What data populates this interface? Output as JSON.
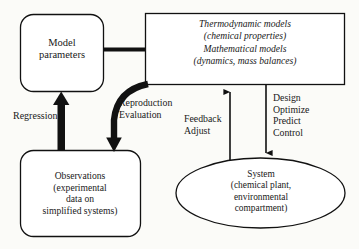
{
  "diagram": {
    "background_color": "#fbfbf8",
    "stroke_color": "#111111",
    "text_color": "#191919",
    "nodes": {
      "model_parameters": {
        "shape": "rounded-rectangle",
        "lines": [
          "Model",
          "parameters"
        ]
      },
      "models_box": {
        "shape": "rectangle",
        "style": "italic",
        "lines": [
          "Thermodynamic models",
          "(chemical properties)",
          "Mathematical models",
          "(dynamics, mass balances)"
        ]
      },
      "observations": {
        "shape": "rounded-rectangle",
        "lines": [
          "Observations",
          "(experimental",
          "data on",
          "simplified systems)"
        ]
      },
      "system": {
        "shape": "ellipse",
        "lines": [
          "System",
          "(chemical plant,",
          "environmental",
          "compartment)"
        ]
      }
    },
    "edge_labels": {
      "regression": [
        "Regression"
      ],
      "reproduction_evaluation": [
        "Reproduction",
        "Evaluation"
      ],
      "feedback_adjust": [
        "Feedback",
        "Adjust"
      ],
      "design_optimize": [
        "Design",
        "Optimize",
        "Predict",
        "Control"
      ]
    },
    "edges": [
      {
        "name": "params-to-models",
        "from": "model_parameters",
        "to": "models_box",
        "style": "thick-line",
        "arrowhead": "none"
      },
      {
        "name": "observations-to-params",
        "from": "observations",
        "to": "model_parameters",
        "style": "thick-arrow",
        "direction": "up",
        "label": "Regression"
      },
      {
        "name": "models-to-observations",
        "from": "models_box",
        "to": "observations",
        "style": "thick-curved-arrow",
        "direction": "down",
        "label": "Reproduction Evaluation"
      },
      {
        "name": "system-to-models",
        "from": "system",
        "to": "models_box",
        "style": "thin-arrow",
        "direction": "up",
        "label": "Feedback Adjust"
      },
      {
        "name": "models-to-system",
        "from": "models_box",
        "to": "system",
        "style": "thin-arrow",
        "direction": "down",
        "label": "Design Optimize Predict Control"
      }
    ]
  }
}
